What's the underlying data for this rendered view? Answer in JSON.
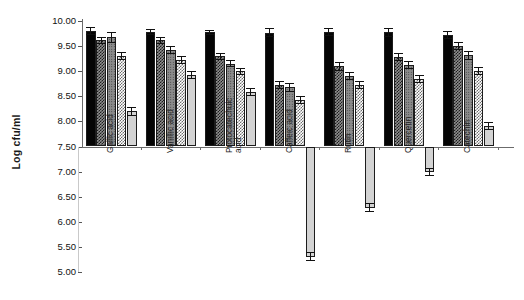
{
  "chart_data": {
    "type": "bar",
    "title": "",
    "subtitle": "",
    "xlabel": "",
    "ylabel": "Log cfu/ml",
    "ylim": [
      5.0,
      10.0
    ],
    "ytick_step": 0.5,
    "baseline": 7.5,
    "grid": false,
    "legend_position": "none",
    "ytick_labels": [
      "10.00",
      "9.50",
      "9.00",
      "8.50",
      "8.00",
      "7.50",
      "7.00",
      "6.50",
      "6.00",
      "5.50",
      "5.00"
    ],
    "ytick_values": [
      10.0,
      9.5,
      9.0,
      8.5,
      8.0,
      7.5,
      7.0,
      6.5,
      6.0,
      5.5,
      5.0
    ],
    "categories": [
      "Gallic acid",
      "Vanillic acid",
      "Protocatechuic acid",
      "Caffeic acid",
      "Rutin",
      "Quercetin",
      "Catechin"
    ],
    "category_lines": [
      [
        "Gallic acid"
      ],
      [
        "Vanillic acid"
      ],
      [
        "Protocatechuic",
        "acid"
      ],
      [
        "Caffeic acid"
      ],
      [
        "Rutin"
      ],
      [
        "Quercetin"
      ],
      [
        "Catechin"
      ]
    ],
    "series": [
      {
        "name": "series-1",
        "pattern": "solid-black",
        "values": [
          9.8,
          9.78,
          9.78,
          9.77,
          9.78,
          9.78,
          9.72
        ],
        "errors": [
          0.08,
          0.06,
          0.05,
          0.09,
          0.08,
          0.09,
          0.08
        ]
      },
      {
        "name": "series-2",
        "pattern": "check-dark",
        "values": [
          9.62,
          9.62,
          9.3,
          8.72,
          9.1,
          9.28,
          9.5
        ],
        "errors": [
          0.07,
          0.07,
          0.07,
          0.08,
          0.09,
          0.08,
          0.08
        ]
      },
      {
        "name": "series-3",
        "pattern": "gray-dot",
        "values": [
          9.68,
          9.42,
          9.15,
          8.68,
          8.9,
          9.12,
          9.32
        ],
        "errors": [
          0.11,
          0.08,
          0.07,
          0.09,
          0.08,
          0.08,
          0.09
        ]
      },
      {
        "name": "series-4",
        "pattern": "check-light",
        "values": [
          9.3,
          9.22,
          9.0,
          8.42,
          8.72,
          8.85,
          9.0
        ],
        "errors": [
          0.08,
          0.08,
          0.07,
          0.08,
          0.08,
          0.08,
          0.08
        ]
      },
      {
        "name": "series-5",
        "pattern": "light-gray",
        "values": [
          8.2,
          8.92,
          8.58,
          5.3,
          6.28,
          7.0,
          7.9
        ],
        "errors": [
          0.09,
          0.08,
          0.08,
          0.09,
          0.09,
          0.08,
          0.08
        ]
      }
    ]
  },
  "axis": {
    "y_title": "Log cfu/ml"
  }
}
